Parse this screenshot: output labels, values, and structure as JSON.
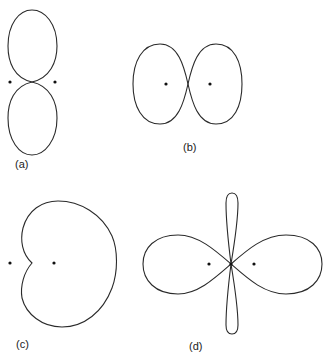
{
  "figure": {
    "panels": [
      {
        "id": "a",
        "label": "(a)",
        "shape": "two vertically stacked lobes touching at a point",
        "foci": 2
      },
      {
        "id": "b",
        "label": "(b)",
        "shape": "two horizontally adjacent lobes touching at a point",
        "foci": 2
      },
      {
        "id": "c",
        "label": "(c)",
        "shape": "cardioid-like curve with a cusp",
        "foci": 2
      },
      {
        "id": "d",
        "label": "(d)",
        "shape": "four-lobed curve: two large horizontal lobes and two thin vertical petals crossing at center",
        "foci": 2
      }
    ]
  },
  "colors": {
    "stroke": "#2a2a2a",
    "dot": "#111111",
    "background": "#ffffff"
  }
}
